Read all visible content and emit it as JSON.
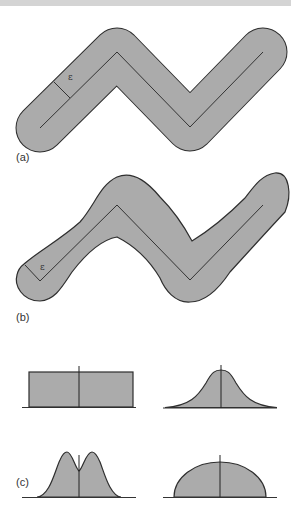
{
  "figure": {
    "colors": {
      "fill": "#ababab",
      "outline": "#2e2e2e",
      "centerline": "#333333"
    },
    "panels": [
      {
        "id": "a",
        "label": "(a)",
        "epsilon": "ε",
        "description": "constant-width buffer (tube) around a zigzag polyline"
      },
      {
        "id": "b",
        "label": "(b)",
        "epsilon": "ε",
        "description": "variable-width buffer around the same zigzag polyline"
      },
      {
        "id": "c",
        "label": "(c)",
        "description": "buffer width profiles",
        "profiles": [
          "rectangular (uniform)",
          "gaussian (bell)",
          "bimodal",
          "semi-elliptic"
        ]
      }
    ]
  }
}
